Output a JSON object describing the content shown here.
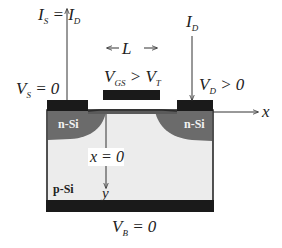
{
  "diagram": {
    "type": "MOSFET cross-section",
    "labels": {
      "source_current": {
        "main": "I",
        "sub": "S",
        "eq": " = ",
        "main2": "I",
        "sub2": "D"
      },
      "drain_current": {
        "main": "I",
        "sub": "D"
      },
      "channel_length": "← L →",
      "gate_voltage": {
        "main": "V",
        "sub": "GS",
        "rel": " > ",
        "main2": "V",
        "sub2": "T"
      },
      "source_voltage": {
        "main": "V",
        "sub": "S",
        "rel": " = 0"
      },
      "drain_voltage": {
        "main": "V",
        "sub": "D",
        "rel": " > 0"
      },
      "body_voltage": {
        "main": "V",
        "sub": "B",
        "rel": " = 0"
      },
      "x_axis": "x",
      "x_origin": "x = 0",
      "y_axis": "y"
    },
    "regions": {
      "source": "n-Si",
      "drain": "n-Si",
      "substrate": "p-Si"
    },
    "colors": {
      "contact": "#1a1a1a",
      "n_region": "#6b6b6b",
      "p_region": "#ececec",
      "channel": "#5a5a5a",
      "line": "#333333",
      "region_text_light": "#f2f2f2",
      "region_text_dark": "#222222"
    }
  }
}
